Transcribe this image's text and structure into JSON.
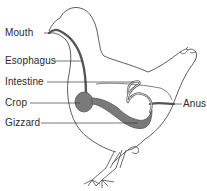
{
  "diagram": {
    "labels": {
      "mouth": "Mouth",
      "esophagus": "Esophagus",
      "intestine": "Intestine",
      "crop": "Crop",
      "gizzard": "Gizzard",
      "anus": "Anus"
    },
    "colors": {
      "outline": "#4a4a4a",
      "organ_fill": "#7a7a7a",
      "tract_stroke": "#555555",
      "text": "#2a2a2a",
      "background": "#ffffff"
    }
  }
}
